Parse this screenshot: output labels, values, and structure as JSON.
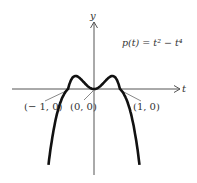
{
  "chart_data": {
    "type": "line",
    "title": "",
    "equation": "p(t) = t² − t⁴",
    "xlabel": "t",
    "ylabel": "y",
    "series": [
      {
        "name": "p(t) = t^2 - t^4",
        "x": [
          -1.4,
          -1.2,
          -1.0,
          -0.8,
          -0.707,
          -0.5,
          -0.3,
          0,
          0.3,
          0.5,
          0.707,
          0.8,
          1.0,
          1.2,
          1.4
        ],
        "values": [
          -1.88,
          -0.63,
          0,
          0.23,
          0.25,
          0.19,
          0.08,
          0,
          0.08,
          0.19,
          0.25,
          0.23,
          0,
          -0.63,
          -1.88
        ]
      }
    ],
    "annotations": [
      "(−1, 0)",
      "(0, 0)",
      "(1, 0)"
    ],
    "grid": false
  },
  "labels": {
    "y_axis": "y",
    "t_axis": "t",
    "equation": "p(t) = t² − t⁴",
    "pt_neg1": "(− 1, 0)",
    "pt_0": "(0, 0)",
    "pt_1": "(1, 0)"
  }
}
